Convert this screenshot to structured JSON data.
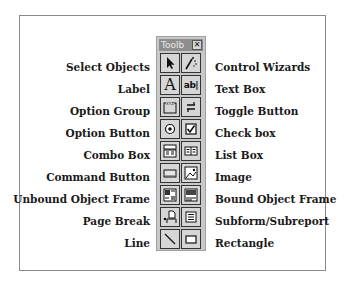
{
  "toolbox": {
    "title": "Toolb",
    "close_label": "✕"
  },
  "left_labels": [
    "Select Objects",
    "Label",
    "Option Group",
    "Option Button",
    "Combo Box",
    "Command Button",
    "Unbound Object Frame",
    "Page Break",
    "Line"
  ],
  "right_labels": [
    "Control Wizards",
    "Text Box",
    "Toggle Button",
    "Check box",
    "List Box",
    "Image",
    "Bound Object Frame",
    "Subform/Subreport",
    "Rectangle"
  ],
  "buttons": [
    {
      "left_icon": "select-objects-icon",
      "right_icon": "control-wizards-icon"
    },
    {
      "left_icon": "label-icon",
      "right_icon": "text-box-icon"
    },
    {
      "left_icon": "option-group-icon",
      "right_icon": "toggle-button-icon"
    },
    {
      "left_icon": "option-button-icon",
      "right_icon": "check-box-icon"
    },
    {
      "left_icon": "combo-box-icon",
      "right_icon": "list-box-icon"
    },
    {
      "left_icon": "command-button-icon",
      "right_icon": "image-icon"
    },
    {
      "left_icon": "unbound-object-frame-icon",
      "right_icon": "bound-object-frame-icon"
    },
    {
      "left_icon": "page-break-icon",
      "right_icon": "subform-subreport-icon"
    },
    {
      "left_icon": "line-icon",
      "right_icon": "rectangle-icon"
    }
  ],
  "icon_glyphs": {
    "label": "A",
    "text_box": "ab|",
    "option_group_tag": "XYZ"
  }
}
